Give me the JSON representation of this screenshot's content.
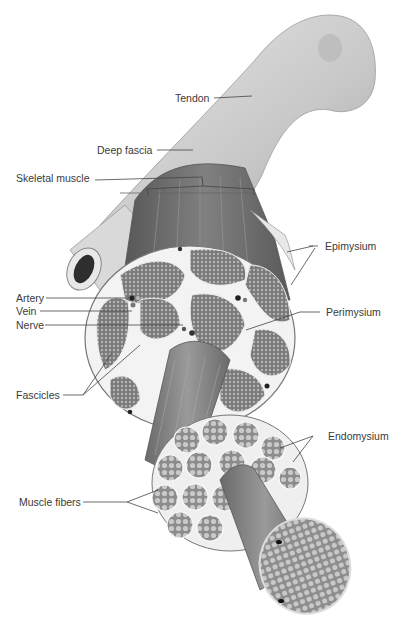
{
  "figure": {
    "colors": {
      "background": "#ffffff",
      "label_text": "#3a3a3a",
      "leader_line": "#444444",
      "tendon": "#d2d2d2",
      "muscle": "#6e6e6e",
      "fascicle": "#8a8a8a",
      "connective_tissue": "#f2f2f2"
    }
  },
  "labels": {
    "tendon": "Tendon",
    "deep_fascia": "Deep fascia",
    "skeletal_muscle": "Skeletal muscle",
    "epimysium": "Epimysium",
    "artery": "Artery",
    "vein": "Vein",
    "nerve": "Nerve",
    "perimysium": "Perimysium",
    "fascicles": "Fascicles",
    "endomysium": "Endomysium",
    "muscle_fibers": "Muscle fibers"
  }
}
